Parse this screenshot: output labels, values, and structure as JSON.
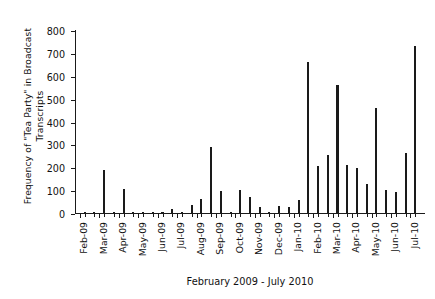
{
  "chart_data": {
    "type": "bar",
    "title": "",
    "subtitle": "",
    "xlabel": "February 2009 - July 2010",
    "ylabel": "Frequency of \"Tea Party\" in Broadcast\nTranscripts",
    "ylim": [
      0,
      800
    ],
    "yticks": [
      0,
      100,
      200,
      300,
      400,
      500,
      600,
      700,
      800
    ],
    "ytick_labels": [
      "0",
      "100",
      "200",
      "300",
      "400",
      "500",
      "600",
      "700",
      "800"
    ],
    "grid": false,
    "legend": false,
    "legend_position": "none",
    "xtick_labels": [
      "Feb-09",
      "Mar-09",
      "Apr-09",
      "May-09",
      "Jun-09",
      "Jul-09",
      "Aug-09",
      "Sep-09",
      "Oct-09",
      "Nov-09",
      "Dec-09",
      "Jan-10",
      "Feb-10",
      "Mar-10",
      "Apr-10",
      "May-10",
      "Jun-10",
      "Jul-10"
    ],
    "categories": [
      "Feb-09 w1",
      "Feb-09 w2",
      "Mar-09 w1",
      "Mar-09 w2",
      "Apr-09 w1",
      "Apr-09 w2",
      "May-09 w1",
      "May-09 w2",
      "Jun-09 w1",
      "Jun-09 w2",
      "Jul-09 w1",
      "Jul-09 w2",
      "Aug-09 w1",
      "Aug-09 w2",
      "Sep-09 w1",
      "Sep-09 w2",
      "Oct-09 w1",
      "Oct-09 w2",
      "Nov-09 w1",
      "Nov-09 w2",
      "Dec-09 w1",
      "Dec-09 w2",
      "Jan-10 w1",
      "Jan-10 w2",
      "Feb-10 w1",
      "Feb-10 w2",
      "Mar-10 w1",
      "Mar-10 w2",
      "Apr-10 w1",
      "Apr-10 w2",
      "May-10 w1",
      "May-10 w2",
      "Jun-10 w1",
      "Jun-10 w2",
      "Jul-10 w1"
    ],
    "values": [
      5,
      2,
      190,
      4,
      106,
      2,
      2,
      2,
      3,
      18,
      2,
      36,
      60,
      290,
      98,
      5,
      102,
      70,
      27,
      3,
      30,
      25,
      57,
      658,
      205,
      253,
      560,
      210,
      197,
      125,
      458,
      100,
      93,
      262,
      730
    ],
    "bar_color": "#1a1a1a",
    "background_color": "#ffffff",
    "axis_color": "#1a1a1a"
  }
}
